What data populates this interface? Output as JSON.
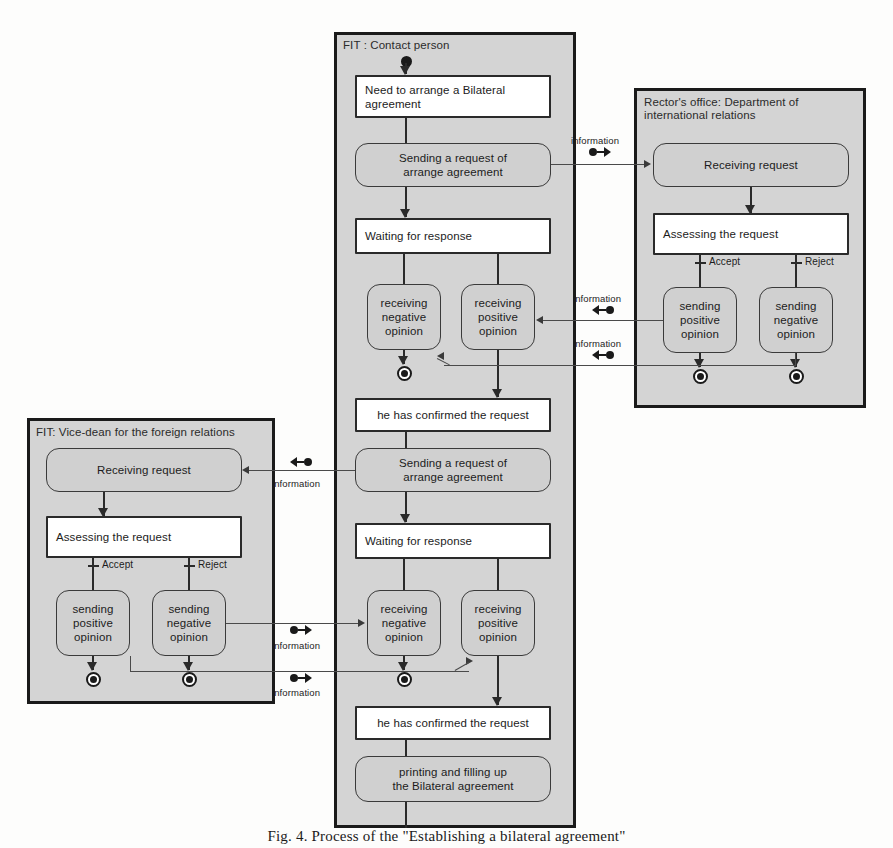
{
  "figure": {
    "caption": "Fig. 4. Process of the \"Establishing a bilateral agreement\""
  },
  "lanes": [
    {
      "id": "contact-person",
      "title": "FIT : Contact person"
    },
    {
      "id": "rectors-office",
      "title": "Rector's office: Department of\ninternational relations"
    },
    {
      "id": "vice-dean",
      "title": "FIT: Vice-dean for the foreign relations"
    }
  ],
  "nodes": {
    "need_agreement": "Need to arrange a Bilateral\nagreement",
    "sending_request_1": "Sending a request of\narrange agreement",
    "waiting_response_1": "Waiting for response",
    "recv_negative_1": "receiving\nnegative\nopinion",
    "recv_positive_1": "receiving\npositive\nopinion",
    "confirmed_1": "he has confirmed the request",
    "sending_request_2": "Sending a request of\narrange agreement",
    "waiting_response_2": "Waiting for response",
    "recv_negative_2": "receiving\nnegative\nopinion",
    "recv_positive_2": "receiving\npositive\nopinion",
    "confirmed_2": "he has confirmed the request",
    "printing_agreement": "printing and filling up\nthe Bilateral agreement",
    "ro_receiving_request": "Receiving request",
    "ro_assessing_request": "Assessing the request",
    "ro_send_positive": "sending\npositive\nopinion",
    "ro_send_negative": "sending\nnegative\nopinion",
    "vd_receiving_request": "Receiving request",
    "vd_assessing_request": "Assessing the request",
    "vd_send_positive": "sending\npositive\nopinion",
    "vd_send_negative": "sending\nnegative\nopinion"
  },
  "guards": {
    "ro_accept": "Accept",
    "ro_reject": "Reject",
    "vd_accept": "Accept",
    "vd_reject": "Reject"
  },
  "signals": {
    "s1": "information",
    "s2": "information",
    "s3": "information",
    "s4": "information",
    "s5": "information",
    "s6": "information"
  },
  "colors": {
    "lane_fill": "#d4d4d4",
    "lane_border": "#1a1a1a",
    "action_fill": "#d0d0d0",
    "state_fill": "#ffffff",
    "line": "#2a2a2a"
  }
}
